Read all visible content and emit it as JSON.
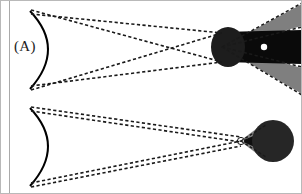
{
  "figure": {
    "width": 302,
    "height": 194,
    "background_color": "#ffffff",
    "frame_color": "#b9b9b9",
    "inner_rule_color": "#aaaaaa"
  },
  "colors": {
    "ray_stroke": "#1a1a1a",
    "mirror_stroke": "#000000",
    "beam_gray": "#7f7f7f",
    "object_black": "#0a0a0a",
    "focus_white": "#ffffff"
  },
  "panels": [
    {
      "id": "A",
      "label": "(A)",
      "mirror": {
        "name": "concave-mirror",
        "top_y": 12,
        "bottom_y": 88,
        "vertex_x": 58,
        "edge_x": 30
      },
      "rays": {
        "style": "dashed",
        "count": 4,
        "crossing_point": [
          185,
          50
        ],
        "description": "Two crossing dashed ray bundles from mirror edges converging at the object"
      },
      "beam": {
        "name": "gray-diverging-beam",
        "apex_x": 222,
        "apex_y": 47,
        "far_top_y": 8,
        "far_bottom_y": 90,
        "far_x": 298
      },
      "object": {
        "name": "dark-rod",
        "ellipse_center": [
          228,
          47
        ],
        "ellipse_rx": 16,
        "ellipse_ry": 20,
        "band_top_y": 32,
        "band_bottom_y": 62,
        "band_right_x": 298
      },
      "focus_dot": {
        "name": "white-focus-dot",
        "center": [
          264,
          47
        ],
        "radius": 3
      }
    },
    {
      "id": "B",
      "label": "(B)",
      "mirror": {
        "name": "concave-mirror",
        "top_y": 12,
        "bottom_y": 88,
        "vertex_x": 58,
        "edge_x": 30
      },
      "rays": {
        "style": "dashed",
        "count": 4,
        "crossing_point": [
          243,
          44
        ],
        "description": "Dashed rays converge to a point focus just left of the dark sphere"
      },
      "beam": {
        "name": "gray-converging-beam",
        "apex_x": 243,
        "apex_y": 44,
        "far_top_y": 14,
        "far_bottom_y": 82,
        "far_x": 262
      },
      "object": {
        "name": "dark-sphere",
        "circle_center": [
          272,
          44
        ],
        "radius": 21
      },
      "focus_dot": {
        "name": "white-focus-dot",
        "center": [
          242,
          44
        ],
        "radius": 4
      }
    }
  ]
}
